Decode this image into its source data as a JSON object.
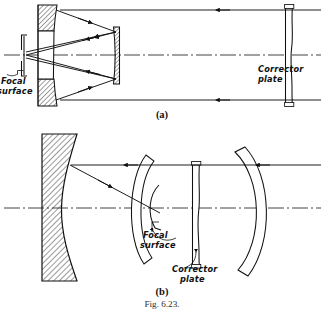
{
  "figure": {
    "number_label": "Fig. 6.23.",
    "panels": [
      {
        "id": "a",
        "caption": "(a)",
        "name": "schmidt-cassegrain-perforated-primary",
        "labels": {
          "focal_surface": "Focal\nsurface",
          "focal_surface_line1": "Focal",
          "focal_surface_line2": "surface",
          "corrector_plate": "Corrector\nplate",
          "corrector_plate_line1": "Corrector",
          "corrector_plate_line2": "plate"
        }
      },
      {
        "id": "b",
        "caption": "(b)",
        "name": "schmidt-camera-curved-focal-surface",
        "labels": {
          "focal_surface_line1": "Focal",
          "focal_surface_line2": "surface",
          "corrector_plate_line1": "Corrector",
          "corrector_plate_line2": "plate"
        }
      }
    ]
  },
  "diagram_data": {
    "type": "optical-ray-diagram",
    "title": "Fig. 6.23.",
    "description": "Two Schmidt telescope configurations shown in cross-section with ray traces along a horizontal optical axis.",
    "panel_a": {
      "caption": "(a)",
      "components": [
        {
          "name": "corrector-plate",
          "kind": "aspheric-plate",
          "x_px": 289,
          "shape": "thin vertical S-curve plate",
          "label": "Corrector plate"
        },
        {
          "name": "primary-mirror",
          "kind": "concave-mirror-perforated",
          "x_px": 45,
          "shape": "hatched meniscus with central aperture"
        },
        {
          "name": "secondary-mirror",
          "kind": "convex-mirror",
          "x_px": 113,
          "shape": "small hatched rectangle on axis"
        },
        {
          "name": "focal-surface",
          "kind": "focal-plane-bracket",
          "x_px": 24,
          "label": "Focal surface"
        },
        {
          "name": "optical-axis",
          "kind": "centerline",
          "y_px": 55,
          "style": "dash-dot"
        }
      ],
      "rays": [
        {
          "name": "upper-incoming-ray",
          "direction": "right-to-left",
          "y_px": 10
        },
        {
          "name": "lower-incoming-ray",
          "direction": "right-to-left",
          "y_px": 100
        },
        {
          "name": "upper-reflected-ray",
          "from": "primary-top",
          "to": "secondary"
        },
        {
          "name": "lower-reflected-ray",
          "from": "primary-bottom",
          "to": "secondary"
        },
        {
          "name": "upper-converging-ray",
          "from": "secondary",
          "to": "focal-surface"
        },
        {
          "name": "lower-converging-ray",
          "from": "secondary",
          "to": "focal-surface"
        }
      ]
    },
    "panel_b": {
      "caption": "(b)",
      "components": [
        {
          "name": "primary-mirror",
          "kind": "thick-concave-mirror",
          "x_px": 58,
          "shape": "hatched block, flat back, concave front"
        },
        {
          "name": "film-holder-arc",
          "kind": "curved-plate-holder",
          "x_px": 140,
          "shape": "large arc"
        },
        {
          "name": "focal-surface-arc",
          "kind": "curved-focal-surface",
          "x_px": 152,
          "shape": "small inner arc",
          "label": "Focal surface"
        },
        {
          "name": "corrector-plate",
          "kind": "aspheric-plate",
          "x_px": 196,
          "shape": "thin vertical S-curve plate",
          "label": "Corrector plate"
        },
        {
          "name": "outer-arc",
          "kind": "curved-baffle",
          "x_px": 248,
          "shape": "large arc"
        },
        {
          "name": "optical-axis",
          "kind": "centerline",
          "y_px": 208,
          "style": "dash-dot"
        }
      ],
      "rays": [
        {
          "name": "incoming-ray",
          "direction": "right-to-left",
          "y_px": 165
        },
        {
          "name": "reflected-ray",
          "from": "primary",
          "to": "focal-surface-arc"
        }
      ]
    }
  }
}
